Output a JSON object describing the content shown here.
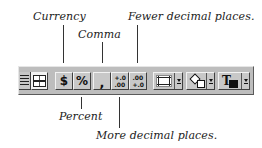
{
  "callouts": {
    "currency": "Currency",
    "comma": "Comma",
    "fewer_decimal": "Fewer decimal places.",
    "percent": "Percent",
    "more_decimal": "More decimal places."
  },
  "toolbar": {
    "buttons": [
      {
        "id": "align-justify",
        "icon": "justify-lines-icon"
      },
      {
        "id": "center-across-columns",
        "icon": "center-across-columns-icon"
      },
      {
        "id": "currency-style",
        "glyph": "$",
        "icon": "dollar-icon"
      },
      {
        "id": "percent-style",
        "glyph": "%",
        "icon": "percent-icon"
      },
      {
        "id": "comma-style",
        "glyph": ",",
        "icon": "comma-icon"
      },
      {
        "id": "increase-decimal",
        "glyph_top": "+.0",
        "glyph_bottom": ".00",
        "icon": "increase-decimal-icon"
      },
      {
        "id": "decrease-decimal",
        "glyph_top": ".00",
        "glyph_bottom": "+.0",
        "icon": "decrease-decimal-icon"
      },
      {
        "id": "borders",
        "icon": "borders-icon",
        "dropdown": true
      },
      {
        "id": "fill-color",
        "icon": "paint-bucket-icon",
        "dropdown": true
      },
      {
        "id": "font-color",
        "glyph": "T",
        "icon": "font-color-icon",
        "dropdown": true
      }
    ]
  }
}
